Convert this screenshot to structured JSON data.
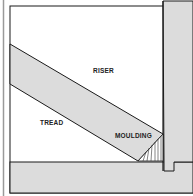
{
  "diagram": {
    "labels": {
      "riser": "RISER",
      "tread": "TREAD",
      "moulding": "MOULDING"
    },
    "colors": {
      "background": "#ffffff",
      "fill": "#dcdcdc",
      "stroke": "#1a1a1a",
      "gutter": "#9a9a9a"
    }
  }
}
